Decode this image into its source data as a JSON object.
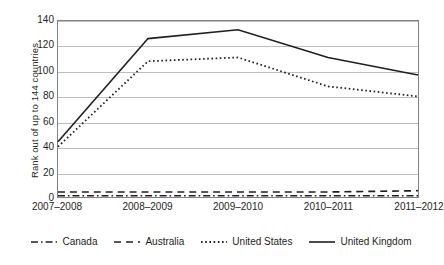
{
  "chart_data": {
    "type": "line",
    "title": "",
    "xlabel": "",
    "ylabel": "Rank out of up to 144 countries",
    "categories": [
      "2007–2008",
      "2008–2009",
      "2009–2010",
      "2010–2011",
      "2011–2012"
    ],
    "ylim": [
      0,
      140
    ],
    "yticks": [
      0,
      20,
      40,
      60,
      80,
      100,
      120,
      140
    ],
    "grid": true,
    "legend_position": "bottom",
    "series": [
      {
        "name": "Canada",
        "values": [
          1,
          1,
          1,
          1,
          1
        ],
        "style": "dash-dot",
        "color": "#231f20"
      },
      {
        "name": "Australia",
        "values": [
          4,
          4,
          4,
          4,
          5
        ],
        "style": "dashed",
        "color": "#231f20"
      },
      {
        "name": "United States",
        "values": [
          40,
          108,
          111,
          88,
          80
        ],
        "style": "dotted",
        "color": "#231f20"
      },
      {
        "name": "United Kingdom",
        "values": [
          44,
          126,
          133,
          111,
          97
        ],
        "style": "solid",
        "color": "#231f20"
      }
    ]
  },
  "axes": {
    "y_title": "Rank out of up to 144 countries",
    "y_tick_labels": [
      "140",
      "120",
      "100",
      "80",
      "60",
      "40",
      "20",
      "0"
    ],
    "x_tick_labels": [
      "2007–2008",
      "2008–2009",
      "2009–2010",
      "2010–2011",
      "2011–2012"
    ]
  },
  "legend": {
    "items": [
      {
        "label": "Canada",
        "style": "dash-dot"
      },
      {
        "label": "Australia",
        "style": "dashed"
      },
      {
        "label": "United States",
        "style": "dotted"
      },
      {
        "label": "United Kingdom",
        "style": "solid"
      }
    ]
  },
  "colors": {
    "ink": "#231f20",
    "gridline": "#bcbec0",
    "border": "#808285",
    "background": "#ffffff"
  }
}
